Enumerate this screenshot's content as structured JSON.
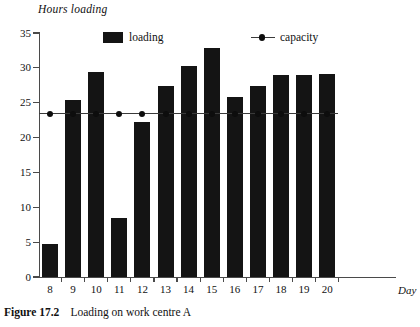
{
  "figure": {
    "caption_label": "Figure 17.2",
    "caption_text": "Loading on work centre A"
  },
  "legend": {
    "loading_label": "loading",
    "capacity_label": "capacity"
  },
  "colors": {
    "bar": "#141414",
    "capacity_line": "#3a3a3a",
    "axis": "#4a4a4a",
    "background": "#ffffff"
  },
  "chart_data": {
    "type": "bar",
    "title": "",
    "ylabel": "Hours loading",
    "xlabel": "Day",
    "ylim": [
      0,
      35
    ],
    "yticks": [
      0,
      5,
      10,
      15,
      20,
      25,
      30,
      35
    ],
    "ytick_labels": [
      "0",
      "5",
      "10",
      "15",
      "20",
      "25",
      "30",
      "35"
    ],
    "grid": false,
    "legend_position": "top-inside",
    "categories": [
      "8",
      "9",
      "10",
      "11",
      "12",
      "13",
      "14",
      "15",
      "16",
      "17",
      "18",
      "19",
      "20"
    ],
    "series": [
      {
        "name": "loading",
        "type": "bar",
        "values": [
          4.8,
          25.4,
          29.4,
          8.5,
          22.3,
          27.4,
          30.3,
          32.9,
          25.8,
          27.4,
          29.0,
          29.0,
          29.1
        ]
      },
      {
        "name": "capacity",
        "type": "line",
        "marker": "circle",
        "values": [
          23.4,
          23.4,
          23.4,
          23.4,
          23.4,
          23.4,
          23.4,
          23.4,
          23.4,
          23.4,
          23.4,
          23.4,
          23.4
        ]
      }
    ]
  }
}
